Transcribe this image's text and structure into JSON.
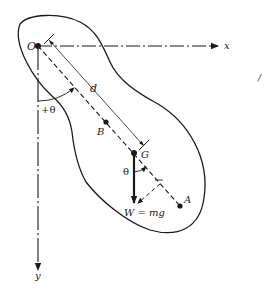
{
  "diagram": {
    "labels": {
      "origin": "O",
      "x_axis": "x",
      "y_axis": "y",
      "distance": "d",
      "angle_positive": "+θ",
      "angle_at_g": "θ",
      "point_b": "B",
      "point_g": "G",
      "point_a": "A",
      "weight": "W = mg",
      "stray_mark": "/"
    },
    "colors": {
      "ink": "#1a1a1a",
      "background": "#ffffff"
    }
  }
}
